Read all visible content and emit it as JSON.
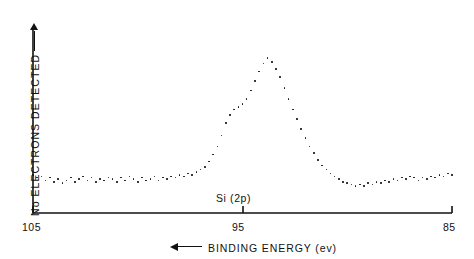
{
  "figure": {
    "background_color": "#ffffff",
    "ink_color": "#111111",
    "annotation": "Si (2p)"
  },
  "axes": {
    "y_label_text": "No  ELECTRONS  DETECTED",
    "y_label_arrow_icon": "arrow-up-icon",
    "x_label_text": "BINDING  ENERGY  (ev)",
    "x_label_arrow_icon": "arrow-left-icon",
    "x_ticks": [
      "105",
      "95",
      "85"
    ]
  },
  "chart_data": {
    "type": "scatter",
    "title": "",
    "subtitle": "",
    "xlabel": "BINDING ENERGY (ev)",
    "ylabel": "No ELECTRONS DETECTED",
    "annotations": [
      {
        "text": "Si (2p)",
        "x": 95.0,
        "y": 0.06
      }
    ],
    "grid": false,
    "legend": "none",
    "xlim": [
      105,
      85
    ],
    "ylim": [
      0,
      1
    ],
    "x_axis_direction": "decreasing",
    "x_tick_values": [
      105,
      95,
      85
    ],
    "x_tick_labels": [
      "105",
      "95",
      "85"
    ],
    "y_tick_values": [],
    "y_tick_labels": [],
    "series": [
      {
        "name": "Si 2p photoelectron signal",
        "marker": "dot",
        "peak_center_ev": 95.0,
        "peak_height_normalized": 1.0,
        "baseline_normalized": 0.12,
        "fwhm_ev": 2.6,
        "shoulder_ev": 96.3,
        "x": [
          105.0,
          104.8,
          104.6,
          104.4,
          104.2,
          104.0,
          103.8,
          103.6,
          103.4,
          103.2,
          103.0,
          102.8,
          102.6,
          102.4,
          102.2,
          102.0,
          101.8,
          101.6,
          101.4,
          101.2,
          101.0,
          100.8,
          100.6,
          100.4,
          100.2,
          100.0,
          99.8,
          99.6,
          99.4,
          99.2,
          99.0,
          98.8,
          98.6,
          98.4,
          98.2,
          98.0,
          97.8,
          97.6,
          97.4,
          97.2,
          97.0,
          96.8,
          96.6,
          96.4,
          96.2,
          96.0,
          95.8,
          95.6,
          95.4,
          95.2,
          95.0,
          94.8,
          94.6,
          94.4,
          94.2,
          94.0,
          93.8,
          93.6,
          93.4,
          93.2,
          93.0,
          92.8,
          92.6,
          92.4,
          92.2,
          92.0,
          91.8,
          91.6,
          91.4,
          91.2,
          91.0,
          90.8,
          90.6,
          90.4,
          90.2,
          90.0,
          89.8,
          89.6,
          89.4,
          89.2,
          89.0,
          88.8,
          88.6,
          88.4,
          88.2,
          88.0,
          87.8,
          87.6,
          87.4,
          87.2,
          87.0,
          86.8,
          86.6,
          86.4,
          86.2,
          86.0,
          85.8,
          85.6,
          85.4,
          85.2,
          85.0
        ],
        "y": [
          0.14,
          0.12,
          0.13,
          0.1,
          0.12,
          0.09,
          0.11,
          0.08,
          0.1,
          0.12,
          0.09,
          0.11,
          0.13,
          0.1,
          0.12,
          0.09,
          0.11,
          0.1,
          0.12,
          0.11,
          0.09,
          0.12,
          0.1,
          0.13,
          0.11,
          0.09,
          0.12,
          0.1,
          0.11,
          0.13,
          0.1,
          0.12,
          0.11,
          0.13,
          0.12,
          0.14,
          0.13,
          0.15,
          0.14,
          0.16,
          0.18,
          0.2,
          0.24,
          0.29,
          0.35,
          0.43,
          0.52,
          0.58,
          0.62,
          0.64,
          0.66,
          0.7,
          0.76,
          0.83,
          0.9,
          0.96,
          1.0,
          0.97,
          0.92,
          0.86,
          0.78,
          0.7,
          0.62,
          0.55,
          0.48,
          0.41,
          0.35,
          0.3,
          0.25,
          0.21,
          0.18,
          0.15,
          0.13,
          0.11,
          0.09,
          0.08,
          0.07,
          0.06,
          0.07,
          0.06,
          0.08,
          0.07,
          0.09,
          0.08,
          0.1,
          0.09,
          0.11,
          0.1,
          0.12,
          0.11,
          0.13,
          0.12,
          0.1,
          0.12,
          0.11,
          0.13,
          0.12,
          0.14,
          0.13,
          0.15,
          0.14
        ]
      }
    ]
  },
  "geometry": {
    "plot_left_px": 33,
    "plot_right_px": 452,
    "plot_bottom_px": 213,
    "plot_top_px": 30,
    "baseline_px": 190,
    "peak_top_px": 58
  }
}
